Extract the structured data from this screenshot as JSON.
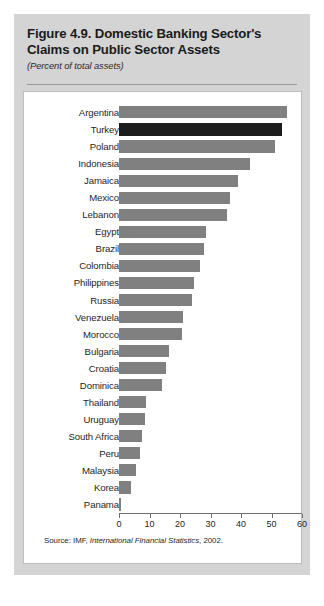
{
  "figure": {
    "title": "Figure 4.9.  Domestic Banking Sector's Claims on Public Sector Assets",
    "subtitle": "(Percent of total assets)",
    "source_prefix": "Source: IMF, ",
    "source_italic": "International Financial Statistics",
    "source_suffix": ", 2002."
  },
  "colors": {
    "panel_background": "#d4d4d4",
    "plot_background": "#ffffff",
    "bar_default": "#808080",
    "bar_highlight": "#1c1c1c",
    "axis": "#6e6e6e",
    "text": "#1f1f1f"
  },
  "chart_data": {
    "type": "bar",
    "orientation": "horizontal",
    "title": "Figure 4.9.  Domestic Banking Sector's Claims on Public Sector Assets",
    "subtitle": "(Percent of total assets)",
    "xlabel": "",
    "ylabel": "",
    "xlim": [
      0,
      60
    ],
    "xticks": [
      0,
      10,
      20,
      30,
      40,
      50,
      60
    ],
    "xtick_labels": [
      "0",
      "10",
      "20",
      "30",
      "40",
      "50",
      "60"
    ],
    "grid": false,
    "legend": null,
    "highlight_category": "Turkey",
    "categories": [
      "Argentina",
      "Turkey",
      "Poland",
      "Indonesia",
      "Jamaica",
      "Mexico",
      "Lebanon",
      "Egypt",
      "Brazil",
      "Colombia",
      "Philippines",
      "Russia",
      "Venezuela",
      "Morocco",
      "Bulgaria",
      "Croatia",
      "Dominica",
      "Thailand",
      "Uruguay",
      "South Africa",
      "Peru",
      "Malaysia",
      "Korea",
      "Panama"
    ],
    "values": [
      55.0,
      53.5,
      51.0,
      43.0,
      39.0,
      36.5,
      35.5,
      28.5,
      28.0,
      26.5,
      24.5,
      24.0,
      21.0,
      20.5,
      16.5,
      15.5,
      14.0,
      9.0,
      8.5,
      7.5,
      7.0,
      5.5,
      4.0,
      0.5
    ]
  }
}
